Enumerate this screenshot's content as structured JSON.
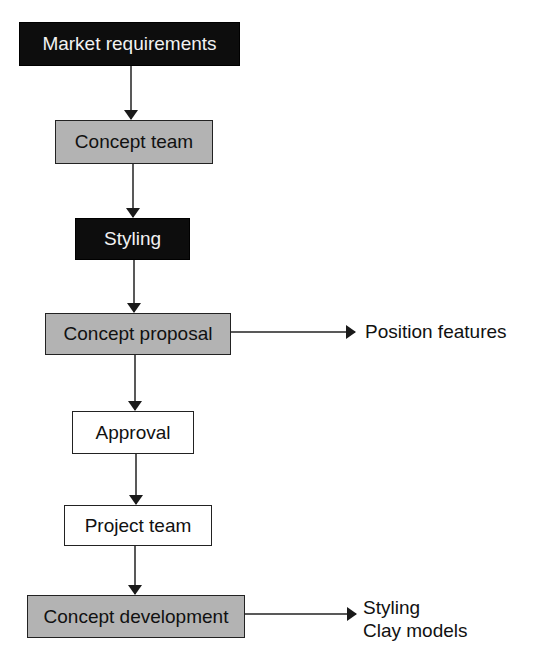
{
  "diagram": {
    "type": "flowchart",
    "nodes": [
      {
        "id": "market",
        "label": "Market requirements",
        "style": "dark"
      },
      {
        "id": "concept_team",
        "label": "Concept team",
        "style": "grey"
      },
      {
        "id": "styling",
        "label": "Styling",
        "style": "dark"
      },
      {
        "id": "concept_proposal",
        "label": "Concept proposal",
        "style": "grey"
      },
      {
        "id": "approval",
        "label": "Approval",
        "style": "white"
      },
      {
        "id": "project_team",
        "label": "Project team",
        "style": "white"
      },
      {
        "id": "concept_development",
        "label": "Concept development",
        "style": "grey"
      }
    ],
    "side_outputs": {
      "proposal": "Position features",
      "development_line1": "Styling",
      "development_line2": "Clay models"
    },
    "edges": [
      [
        "market",
        "concept_team"
      ],
      [
        "concept_team",
        "styling"
      ],
      [
        "styling",
        "concept_proposal"
      ],
      [
        "concept_proposal",
        "approval"
      ],
      [
        "approval",
        "project_team"
      ],
      [
        "project_team",
        "concept_development"
      ],
      [
        "concept_proposal",
        "Position features"
      ],
      [
        "concept_development",
        "Styling / Clay models"
      ]
    ]
  },
  "colors": {
    "dark_fill": "#0d0d0d",
    "grey_fill": "#b3b3b3",
    "white_fill": "#ffffff",
    "line": "#222222"
  }
}
